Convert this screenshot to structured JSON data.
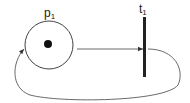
{
  "diagram": {
    "type": "petri-net",
    "places": [
      {
        "id": "p1",
        "label": "p",
        "subscript": "1",
        "tokens": 1
      }
    ],
    "transitions": [
      {
        "id": "t1",
        "label": "t",
        "subscript": "1"
      }
    ],
    "arcs": [
      {
        "from": "p1",
        "to": "t1"
      },
      {
        "from": "t1",
        "to": "p1"
      }
    ],
    "colors": {
      "stroke": "#333333",
      "transition": "#222222",
      "token": "#111111"
    }
  }
}
